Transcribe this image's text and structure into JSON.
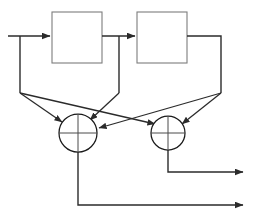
{
  "diagram": {
    "type": "signal-flow-block-diagram",
    "canvas": {
      "width": 255,
      "height": 222
    },
    "colors": {
      "background": "#ffffff",
      "block_stroke": "#7d7d7d",
      "wire_stroke": "#2b2b2b",
      "adder_stroke": "#1a1a1a",
      "adder_cross": "#4a4a4a"
    },
    "blocks": [
      {
        "id": "block-1",
        "label": "",
        "x": 52,
        "y": 12,
        "width": 50,
        "height": 51
      },
      {
        "id": "block-2",
        "label": "",
        "x": 137,
        "y": 12,
        "width": 50,
        "height": 51
      }
    ],
    "adders": [
      {
        "id": "adder-left",
        "label": "",
        "cx": 78,
        "cy": 133,
        "r": 19,
        "incoming_arrows": 3
      },
      {
        "id": "adder-right",
        "label": "",
        "cx": 168,
        "cy": 133,
        "r": 17,
        "incoming_arrows": 2
      }
    ],
    "nodes": {
      "input_start_x": 8,
      "input_y": 36,
      "branch_left_x": 20,
      "branch_left_y": 93,
      "branch_mid_x": 119,
      "branch_mid_y": 93,
      "branch_right_x": 221,
      "branch_right_y": 93,
      "output_upper_y": 172,
      "output_lower_y": 205,
      "output_end_x": 248
    },
    "wires": [
      {
        "id": "input-to-block1",
        "from": "input",
        "to": "block-1",
        "arrow": true
      },
      {
        "id": "input-tap-down",
        "from": "input",
        "to": "branch-left",
        "arrow": false
      },
      {
        "id": "block1-to-block2",
        "from": "block-1",
        "to": "block-2",
        "arrow": true
      },
      {
        "id": "block1-tap-down",
        "from": "block-1",
        "to": "branch-mid",
        "arrow": false
      },
      {
        "id": "block2-tap-down",
        "from": "block-2",
        "to": "branch-right",
        "arrow": false
      },
      {
        "id": "branch-left-to-adder-left",
        "from": "branch-left",
        "to": "adder-left",
        "arrow": true
      },
      {
        "id": "branch-left-to-adder-right",
        "from": "branch-left",
        "to": "adder-right",
        "arrow": true
      },
      {
        "id": "branch-mid-to-adder-left",
        "from": "branch-mid",
        "to": "adder-left",
        "arrow": true
      },
      {
        "id": "branch-right-to-adder-left",
        "from": "branch-right",
        "to": "adder-left",
        "arrow": true
      },
      {
        "id": "branch-right-to-adder-right",
        "from": "branch-right",
        "to": "adder-right",
        "arrow": true
      },
      {
        "id": "adder-right-to-output-upper",
        "from": "adder-right",
        "to": "output-upper",
        "arrow": true
      },
      {
        "id": "adder-left-to-output-lower",
        "from": "adder-left",
        "to": "output-lower",
        "arrow": true
      }
    ],
    "outputs": [
      {
        "id": "output-upper",
        "label": "",
        "y": 172
      },
      {
        "id": "output-lower",
        "label": "",
        "y": 205
      }
    ]
  }
}
